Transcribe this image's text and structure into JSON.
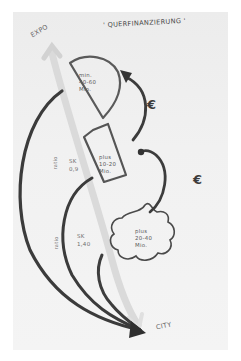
{
  "title": "' QUERFINANZIERUNG '",
  "labels": {
    "start": "EXPO",
    "end": "CITY"
  },
  "zones": [
    {
      "id": "zone-1",
      "prefix": "min.",
      "range": "40-60",
      "unit": "Mio.",
      "shape": "half-circle"
    },
    {
      "id": "zone-2",
      "prefix": "plus",
      "range": "10-20",
      "unit": "Mio.",
      "shape": "trapezoid"
    },
    {
      "id": "zone-3",
      "prefix": "plus",
      "range": "20-40",
      "unit": "Mio.",
      "shape": "cloud"
    }
  ],
  "ratios": [
    {
      "label": "ratio",
      "code": "SK",
      "value": "0,9"
    },
    {
      "label": "ratio",
      "code": "SK",
      "value": "1,40"
    }
  ],
  "flows": [
    {
      "symbol": "€",
      "from": "zone-2",
      "to": "zone-1"
    },
    {
      "symbol": "€",
      "from": "zone-3",
      "to": "zone-2"
    }
  ],
  "colors": {
    "ink": "#3a3a3a",
    "pencil": "#5b5b5b",
    "axis": "#d9d9d9",
    "paper": "#f0f0f0"
  }
}
